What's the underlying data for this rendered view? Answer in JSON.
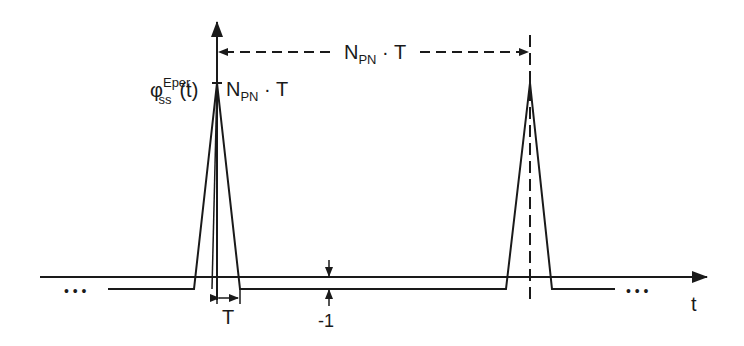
{
  "diagram": {
    "colors": {
      "line": "#1a1a1a",
      "background": "#ffffff"
    },
    "function_label": {
      "symbol": "φ",
      "superscript": "Eper",
      "subscript": "ss",
      "argument": "(t)"
    },
    "peak_label": {
      "main": "N",
      "subscript": "PN",
      "suffix": " · T"
    },
    "period_label": {
      "main": "N",
      "subscript": "PN",
      "suffix": " · T"
    },
    "pulse_width_label": "T",
    "offset_label": "-1",
    "x_axis_label": "t",
    "ellipsis_left": "• • •",
    "ellipsis_right": "• • •"
  }
}
